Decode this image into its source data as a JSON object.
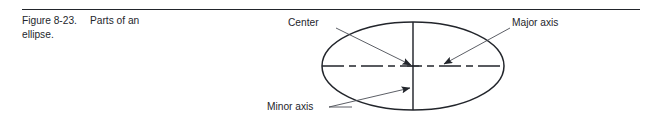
{
  "figure": {
    "caption": {
      "number": "Figure 8-23.",
      "title": "Parts of an",
      "continuation": "ellipse."
    },
    "top_rule_color": "#22252b",
    "line_color": "#22252b",
    "text_color": "#24262c",
    "background": "#ffffff"
  },
  "diagram": {
    "type": "ellipse-parts",
    "labels": {
      "center": "Center",
      "major_axis": "Major axis",
      "minor_axis": "Minor axis"
    },
    "geometry": {
      "center_x": 413,
      "center_y": 66,
      "semi_major": 91,
      "semi_minor": 44,
      "major_axis_style": "dash-dot centerline",
      "minor_axis_style": "solid line"
    },
    "label_positions": {
      "center": {
        "x": 288,
        "y": 26
      },
      "major_axis": {
        "x": 512,
        "y": 26
      },
      "minor_axis": {
        "x": 267,
        "y": 110
      }
    },
    "leaders": [
      {
        "name": "center-leader",
        "from_x": 336,
        "from_y": 28,
        "to_x": 411,
        "to_y": 65,
        "arrow": true
      },
      {
        "name": "major-axis-leader",
        "from_x": 510,
        "from_y": 28,
        "to_x": 444,
        "to_y": 64,
        "arrow": true
      },
      {
        "name": "minor-axis-leader",
        "from_x": 329,
        "from_y": 107,
        "to_x": 410,
        "to_y": 88,
        "arrow": true
      }
    ]
  }
}
